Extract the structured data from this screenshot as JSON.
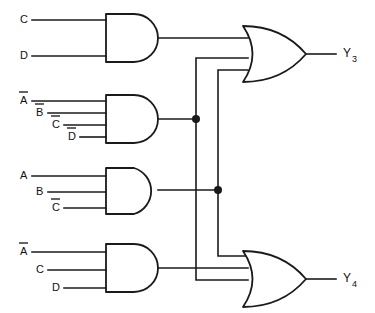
{
  "diagram": {
    "type": "logic-circuit",
    "colors": {
      "line": "#1a1a1a",
      "background": "#ffffff",
      "text": "#111111"
    }
  },
  "gates": [
    {
      "id": "and1",
      "type": "AND",
      "inputs": [
        "C",
        "D"
      ],
      "input_bars": [
        false,
        false
      ],
      "feeds": [
        "or1"
      ]
    },
    {
      "id": "and2",
      "type": "AND",
      "inputs": [
        "A",
        "B",
        "C",
        "D"
      ],
      "input_bars": [
        true,
        true,
        true,
        true
      ],
      "feeds": [
        "or1",
        "or2"
      ]
    },
    {
      "id": "and3",
      "type": "AND",
      "inputs": [
        "A",
        "B",
        "C"
      ],
      "input_bars": [
        false,
        false,
        true
      ],
      "feeds": [
        "or1",
        "or2"
      ]
    },
    {
      "id": "and4",
      "type": "AND",
      "inputs": [
        "A",
        "C",
        "D"
      ],
      "input_bars": [
        true,
        false,
        false
      ],
      "feeds": [
        "or2"
      ]
    },
    {
      "id": "or1",
      "type": "OR",
      "inputs": [
        "and1",
        "and2",
        "and3"
      ],
      "output": "Y3"
    },
    {
      "id": "or2",
      "type": "OR",
      "inputs": [
        "and2",
        "and3",
        "and4"
      ],
      "output": "Y4"
    }
  ],
  "input_labels": [
    {
      "id": "in-c-1",
      "text": "C",
      "bar": false,
      "x": 20,
      "y": 20
    },
    {
      "id": "in-d-1",
      "text": "D",
      "bar": false,
      "x": 20,
      "y": 56
    },
    {
      "id": "in-a-2",
      "text": "A",
      "bar": true,
      "x": 20,
      "y": 97
    },
    {
      "id": "in-b-2",
      "text": "B",
      "bar": true,
      "x": 36,
      "y": 110
    },
    {
      "id": "in-c-2",
      "text": "C",
      "bar": true,
      "x": 52,
      "y": 122
    },
    {
      "id": "in-d-2",
      "text": "D",
      "bar": true,
      "x": 68,
      "y": 134
    },
    {
      "id": "in-a-3",
      "text": "A",
      "bar": false,
      "x": 20,
      "y": 176
    },
    {
      "id": "in-b-3",
      "text": "B",
      "bar": false,
      "x": 36,
      "y": 192
    },
    {
      "id": "in-c-3",
      "text": "C",
      "bar": true,
      "x": 52,
      "y": 208
    },
    {
      "id": "in-a-4",
      "text": "A",
      "bar": true,
      "x": 20,
      "y": 252
    },
    {
      "id": "in-c-4",
      "text": "C",
      "bar": false,
      "x": 36,
      "y": 270
    },
    {
      "id": "in-d-4",
      "text": "D",
      "bar": false,
      "x": 52,
      "y": 288
    }
  ],
  "outputs": [
    {
      "id": "y3",
      "base": "Y",
      "sub": "3",
      "x": 343,
      "y": 54
    },
    {
      "id": "y4",
      "base": "Y",
      "sub": "4",
      "x": 343,
      "y": 279
    }
  ],
  "junctions": [
    {
      "id": "junction-and2-out",
      "x": 196,
      "y": 119
    },
    {
      "id": "junction-and3-out",
      "x": 218,
      "y": 190
    }
  ]
}
